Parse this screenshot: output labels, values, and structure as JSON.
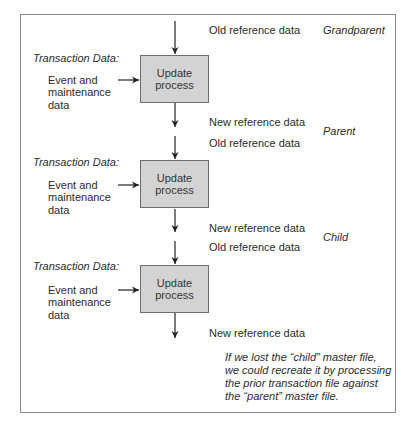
{
  "diagram": {
    "generations": [
      {
        "label": "Grandparent",
        "old_reference_label": "Old reference data"
      },
      {
        "label": "Parent",
        "new_reference_label": "New reference data",
        "old_reference_label": "Old reference data"
      },
      {
        "label": "Child",
        "new_reference_label": "New reference data",
        "old_reference_label": "Old reference data"
      }
    ],
    "stages": [
      {
        "transaction_heading": "Transaction Data:",
        "input_lines": [
          "Event and",
          "maintenance",
          "data"
        ],
        "process_lines": [
          "Update",
          "process"
        ]
      },
      {
        "transaction_heading": "Transaction Data:",
        "input_lines": [
          "Event and",
          "maintenance",
          "data"
        ],
        "process_lines": [
          "Update",
          "process"
        ]
      },
      {
        "transaction_heading": "Transaction Data:",
        "input_lines": [
          "Event and",
          "maintenance",
          "data"
        ],
        "process_lines": [
          "Update",
          "process"
        ]
      }
    ],
    "final_output_label": "New reference data",
    "note_lines": [
      "If we lost the “child” master file,",
      "we could recreate it by processing",
      "the prior transaction file against",
      "the “parent” master file."
    ],
    "colors": {
      "process_fill": "#d3d3d3",
      "process_border": "#6e6e6e",
      "frame_border": "#8a8a8a",
      "text": "#2b2b2b",
      "arrow": "#222222"
    }
  }
}
